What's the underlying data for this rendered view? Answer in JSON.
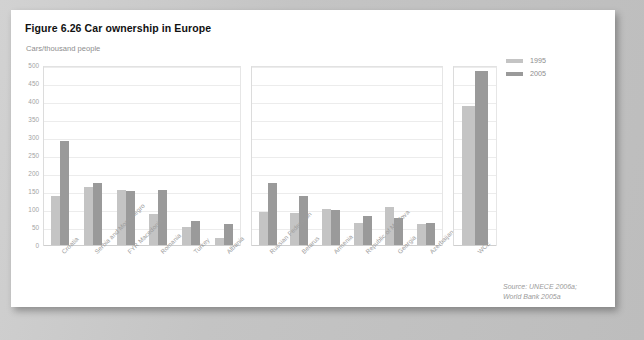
{
  "figure": {
    "title": "Figure 6.26 Car ownership in Europe",
    "unit_label": "Cars/thousand people",
    "source_line_1": "Source: UNECE 2006a;",
    "source_line_2": "World Bank 2005a"
  },
  "legend": {
    "position": "top-right",
    "items": [
      {
        "label": "1995",
        "color": "#c4c4c4"
      },
      {
        "label": "2005",
        "color": "#9a9a9a"
      }
    ]
  },
  "chart_data": {
    "type": "bar",
    "title": "Figure 6.26 Car ownership in Europe",
    "subtitle": "Cars/thousand people",
    "xlabel": "",
    "ylabel": "Cars/thousand people",
    "ylim": [
      0,
      500
    ],
    "ytick_labels": [
      "500",
      "450",
      "400",
      "350",
      "300",
      "250",
      "200",
      "150",
      "100",
      "50",
      "0"
    ],
    "ytick_values": [
      500,
      450,
      400,
      350,
      300,
      250,
      200,
      150,
      100,
      50,
      0
    ],
    "grid": true,
    "grid_axis": "y",
    "legend_position": "top-right",
    "panels": [
      {
        "name": "South-Eastern Europe",
        "categories": [
          "Croatia",
          "Serbia and Montenegro",
          "FYR Macedonia",
          "Romania",
          "Turkey",
          "Albania"
        ],
        "series": [
          {
            "name": "1995",
            "color": "#c4c4c4",
            "values": [
              137,
              160,
              153,
              85,
              50,
              20
            ]
          },
          {
            "name": "2005",
            "color": "#9a9a9a",
            "values": [
              290,
              172,
              150,
              152,
              68,
              58
            ]
          }
        ]
      },
      {
        "name": "Eastern Europe, Caucasus",
        "categories": [
          "Russian Federation",
          "Belarus",
          "Armenia",
          "Republic of Moldova",
          "Georgia",
          "Azerbaijan"
        ],
        "series": [
          {
            "name": "1995",
            "color": "#c4c4c4",
            "values": [
              92,
              90,
              100,
              62,
              105,
              57
            ]
          },
          {
            "name": "2005",
            "color": "#9a9a9a",
            "values": [
              172,
              135,
              98,
              80,
              75,
              60
            ]
          }
        ]
      },
      {
        "name": "Western and Central Europe",
        "categories": [
          "WCE"
        ],
        "series": [
          {
            "name": "1995",
            "color": "#c4c4c4",
            "values": [
              385
            ]
          },
          {
            "name": "2005",
            "color": "#9a9a9a",
            "values": [
              482
            ]
          }
        ]
      }
    ]
  }
}
